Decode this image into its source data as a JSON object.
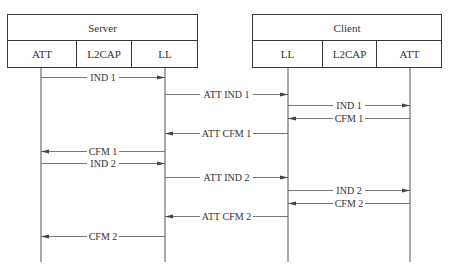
{
  "diagram": {
    "type": "sequence",
    "colors": {
      "line": "#555555",
      "text": "#333333",
      "background": "#ffffff"
    },
    "groups": [
      {
        "id": "server",
        "title": "Server",
        "x": 7,
        "width": 191,
        "layers": [
          {
            "id": "server-att",
            "label": "ATT",
            "x": 0,
            "width": 68,
            "lifeline_x": 41
          },
          {
            "id": "server-l2cap",
            "label": "L2CAP",
            "x": 68,
            "width": 55
          },
          {
            "id": "server-ll",
            "label": "LL",
            "x": 123,
            "width": 68,
            "lifeline_x": 165
          }
        ]
      },
      {
        "id": "client",
        "title": "Client",
        "x": 252,
        "width": 190,
        "layers": [
          {
            "id": "client-ll",
            "label": "LL",
            "x": 0,
            "width": 69,
            "lifeline_x": 288
          },
          {
            "id": "client-l2cap",
            "label": "L2CAP",
            "x": 69,
            "width": 54
          },
          {
            "id": "client-att",
            "label": "ATT",
            "x": 123,
            "width": 67,
            "lifeline_x": 410
          }
        ]
      }
    ],
    "lifeline_bottom": 262,
    "messages": [
      {
        "label": "IND 1",
        "from": "server-att",
        "to": "server-ll",
        "y": 77
      },
      {
        "label": "ATT IND 1",
        "from": "server-ll",
        "to": "client-ll",
        "y": 94
      },
      {
        "label": "IND 1",
        "from": "client-ll",
        "to": "client-att",
        "y": 105
      },
      {
        "label": "CFM 1",
        "from": "client-att",
        "to": "client-ll",
        "y": 118
      },
      {
        "label": "ATT CFM 1",
        "from": "client-ll",
        "to": "server-ll",
        "y": 133
      },
      {
        "label": "CFM 1",
        "from": "server-ll",
        "to": "server-att",
        "y": 151
      },
      {
        "label": "IND 2",
        "from": "server-att",
        "to": "server-ll",
        "y": 163
      },
      {
        "label": "ATT IND 2",
        "from": "server-ll",
        "to": "client-ll",
        "y": 177
      },
      {
        "label": "IND 2",
        "from": "client-ll",
        "to": "client-att",
        "y": 190
      },
      {
        "label": "CFM 2",
        "from": "client-att",
        "to": "client-ll",
        "y": 203
      },
      {
        "label": "ATT CFM 2",
        "from": "client-ll",
        "to": "server-ll",
        "y": 216
      },
      {
        "label": "CFM 2",
        "from": "server-ll",
        "to": "server-att",
        "y": 236
      }
    ]
  }
}
